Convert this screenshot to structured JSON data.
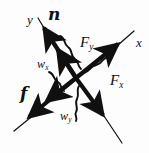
{
  "figure": {
    "kind": "force-vector-diagram",
    "width": 149,
    "height": 153,
    "background_color": "#fdfdfd",
    "stroke_color": "#101010",
    "origin": {
      "x": 76,
      "y": 78
    }
  },
  "axes": [
    {
      "id": "x-axis",
      "label": "x",
      "label_position": {
        "x": 136,
        "y": 36
      },
      "from": {
        "x": 14,
        "y": 131
      },
      "to": {
        "x": 134,
        "y": 31
      },
      "direction_deg": -39.8
    },
    {
      "id": "y-axis",
      "label": "y",
      "label_position": {
        "x": 27,
        "y": 13
      },
      "from": {
        "x": 120,
        "y": 140
      },
      "to": {
        "x": 40,
        "y": 18
      },
      "direction_deg": -56.7
    }
  ],
  "vectors": [
    {
      "id": "normal-force",
      "label": "n",
      "style": "bold-italic",
      "description": "normal force, along +y axis, up-left",
      "tail": {
        "x": 76,
        "y": 78
      },
      "head": {
        "x": 42,
        "y": 24
      },
      "label_position": {
        "x": 48,
        "y": 6
      }
    },
    {
      "id": "friction-force",
      "label": "f",
      "style": "bold-italic",
      "description": "friction force, along -x axis, down-left",
      "tail": {
        "x": 76,
        "y": 78
      },
      "head": {
        "x": 26,
        "y": 120
      },
      "label_position": {
        "x": 20,
        "y": 85
      }
    },
    {
      "id": "force-y-component",
      "label": "F",
      "subscript": "y",
      "description": "y component of weight, up-left along y",
      "tail": {
        "x": 76,
        "y": 78
      },
      "head": {
        "x": 56,
        "y": 46
      },
      "label_position": {
        "x": 80,
        "y": 35
      }
    },
    {
      "id": "force-x-component",
      "label": "F",
      "subscript": "x",
      "description": "x component, up-right along x",
      "tail": {
        "x": 76,
        "y": 78
      },
      "head": {
        "x": 120,
        "y": 41
      },
      "label_position": {
        "x": 110,
        "y": 73
      }
    },
    {
      "id": "weight-x-component",
      "label": "w",
      "subscript": "x",
      "description": "weight x component, down-left along x",
      "tail": {
        "x": 76,
        "y": 78
      },
      "head": {
        "x": 44,
        "y": 103
      },
      "label_position": {
        "x": 37,
        "y": 58
      }
    },
    {
      "id": "weight-y-component",
      "label": "w",
      "subscript": "y",
      "description": "weight y component, down-right along y",
      "tail": {
        "x": 76,
        "y": 78
      },
      "head": {
        "x": 104,
        "y": 118
      },
      "label_position": {
        "x": 60,
        "y": 110
      }
    }
  ],
  "braces": [
    {
      "id": "brace-Fy",
      "pairs_with": "force-y-component"
    },
    {
      "id": "brace-Fx",
      "pairs_with": "force-x-component"
    },
    {
      "id": "brace-wx",
      "pairs_with": "weight-x-component"
    },
    {
      "id": "brace-wy",
      "pairs_with": "weight-y-component"
    }
  ],
  "labels": {
    "y_axis": "y",
    "x_axis": "x",
    "normal": "n",
    "friction": "f",
    "force_base": "F",
    "weight_base": "w",
    "sub_x": "x",
    "sub_y": "y"
  }
}
